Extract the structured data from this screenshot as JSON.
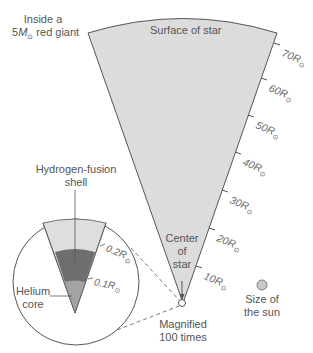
{
  "title": {
    "line1": "Inside a",
    "line2_prefix": "5",
    "line2_M": "M",
    "line2_sub": "⊙",
    "line2_suffix": " red giant"
  },
  "labels": {
    "surface": "Surface of star",
    "center_l1": "Center",
    "center_l2": "of",
    "center_l3": "star",
    "magnified_l1": "Magnified",
    "magnified_l2": "100 times",
    "sun_l1": "Size of",
    "sun_l2": "the sun",
    "hshell_l1": "Hydrogen-fusion",
    "hshell_l2": "shell",
    "core_l1": "Helium",
    "core_l2": "core"
  },
  "radius_ticks": [
    {
      "value": "70",
      "unit": "R",
      "sub": "⊙"
    },
    {
      "value": "60",
      "unit": "R",
      "sub": "⊙"
    },
    {
      "value": "50",
      "unit": "R",
      "sub": "⊙"
    },
    {
      "value": "40",
      "unit": "R",
      "sub": "⊙"
    },
    {
      "value": "30",
      "unit": "R",
      "sub": "⊙"
    },
    {
      "value": "20",
      "unit": "R",
      "sub": "⊙"
    },
    {
      "value": "10",
      "unit": "R",
      "sub": "⊙"
    }
  ],
  "inset_ticks": [
    {
      "value": "0.2",
      "unit": "R",
      "sub": "⊙"
    },
    {
      "value": "0.1",
      "unit": "R",
      "sub": "⊙"
    }
  ],
  "colors": {
    "star_fill": "#dcdcdc",
    "outer_envelope_inset": "#dedede",
    "hydrogen_shell": "#6e6e6e",
    "helium_core": "#a3a3a3",
    "sun_fill": "#c8c8c8",
    "outline": "#555555"
  }
}
